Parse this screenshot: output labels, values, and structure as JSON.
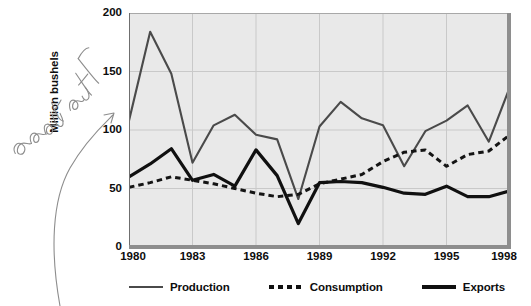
{
  "chart_data": {
    "type": "line",
    "title": "",
    "xlabel": "",
    "ylabel": "Million bushels",
    "xlim": [
      1980,
      1998
    ],
    "ylim": [
      0,
      200
    ],
    "yticks": [
      0,
      50,
      100,
      150,
      200
    ],
    "xticks": [
      1980,
      1983,
      1986,
      1989,
      1992,
      1995,
      1998
    ],
    "grid": true,
    "legend_position": "bottom",
    "x": [
      1980,
      1981,
      1982,
      1983,
      1984,
      1985,
      1986,
      1987,
      1988,
      1989,
      1990,
      1991,
      1992,
      1993,
      1994,
      1995,
      1996,
      1997,
      1998
    ],
    "series": [
      {
        "name": "Production",
        "style": "solid-thin",
        "color": "#4a4a4a",
        "values": [
          108,
          184,
          148,
          72,
          104,
          113,
          96,
          92,
          41,
          103,
          124,
          110,
          104,
          69,
          99,
          108,
          121,
          90,
          137
        ]
      },
      {
        "name": "Consumption",
        "style": "dashed",
        "color": "#141414",
        "values": [
          51,
          55,
          60,
          57,
          54,
          50,
          46,
          43,
          45,
          54,
          58,
          62,
          73,
          81,
          83,
          69,
          79,
          82,
          96
        ]
      },
      {
        "name": "Exports",
        "style": "solid-thick",
        "color": "#101010",
        "values": [
          60,
          71,
          84,
          57,
          62,
          52,
          83,
          61,
          20,
          55,
          56,
          55,
          51,
          46,
          45,
          52,
          43,
          43,
          48
        ]
      }
    ]
  },
  "axes": {
    "y_title": "Million bushels",
    "y_tick_labels": [
      "200",
      "150",
      "100",
      "50",
      "0"
    ],
    "x_tick_labels": [
      "1980",
      "1983",
      "1986",
      "1989",
      "1992",
      "1995",
      "1998"
    ]
  },
  "legend": {
    "items": [
      {
        "label": "Production",
        "swatch": "solid-thin-line-icon"
      },
      {
        "label": "Consumption",
        "swatch": "dashed-line-icon"
      },
      {
        "label": "Exports",
        "swatch": "solid-thick-line-icon"
      }
    ]
  },
  "annotation": {
    "handwriting": "cursive-handwritten-note",
    "arrow": "curved-arrow-to-y-axis-label"
  },
  "colors": {
    "plot_background": "#e9e9e9",
    "production": "#4a4a4a",
    "consumption": "#141414",
    "exports": "#101010",
    "grid": "#c9c9c9",
    "annotation_ink": "#8a8a8a"
  }
}
